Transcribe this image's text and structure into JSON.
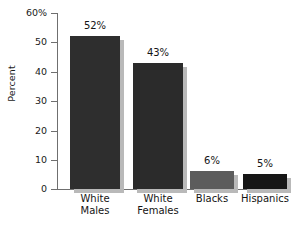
{
  "chart_data": {
    "type": "bar",
    "title": "",
    "xlabel": "",
    "ylabel": "Percent",
    "categories": [
      "White Males",
      "White Females",
      "Blacks",
      "Hispanics"
    ],
    "values": [
      52,
      43,
      6,
      5
    ],
    "data_labels": [
      "52%",
      "43%",
      "6%",
      "5%"
    ],
    "ylim": [
      0,
      60
    ],
    "ytick_values": [
      0,
      10,
      20,
      30,
      40,
      50,
      60
    ],
    "ytick_labels": [
      "0",
      "10",
      "20",
      "30",
      "40",
      "50",
      "60%"
    ],
    "grid": false,
    "legend": null,
    "series": [
      {
        "name": "Percent",
        "values": [
          52,
          43,
          6,
          5
        ]
      }
    ],
    "bar_colors": [
      "#2e2e2e",
      "#2b2b2b",
      "#5c5c5c",
      "#161616"
    ],
    "shadow_color": "#b9b9b9",
    "axis_color": "#6f6f6f",
    "background_color": "#ffffff",
    "category_lines": [
      [
        "White",
        "Males"
      ],
      [
        "White",
        "Females"
      ],
      [
        "Blacks"
      ],
      [
        "Hispanics"
      ]
    ]
  }
}
